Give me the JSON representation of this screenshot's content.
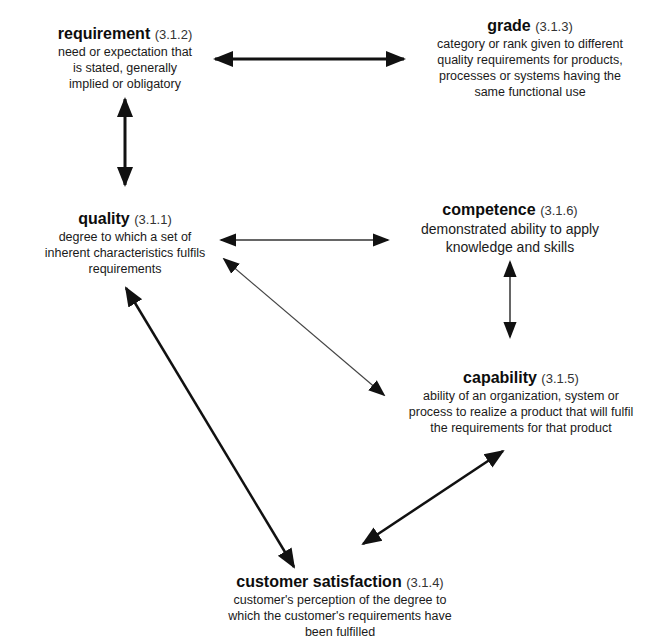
{
  "diagram": {
    "concepts": [
      {
        "id": "requirement",
        "term": "requirement",
        "ref": "(3.1.2)",
        "definition": "need or expectation that\nis stated, generally\nimplied or obligatory"
      },
      {
        "id": "grade",
        "term": "grade",
        "ref": "(3.1.3)",
        "definition": "category or rank given to different\nquality requirements for products,\nprocesses or systems having the\nsame functional use"
      },
      {
        "id": "quality",
        "term": "quality",
        "ref": "(3.1.1)",
        "definition": "degree to which a set of\ninherent characteristics fulfils\nrequirements"
      },
      {
        "id": "competence",
        "term": "competence",
        "ref": "(3.1.6)",
        "definition": "demonstrated ability to apply\nknowledge and skills"
      },
      {
        "id": "capability",
        "term": "capability",
        "ref": "(3.1.5)",
        "definition": "ability of an organization, system or\nprocess to realize a product that will fulfil\nthe requirements for that product"
      },
      {
        "id": "customer_satisfaction",
        "term": "customer satisfaction",
        "ref": "(3.1.4)",
        "definition": "customer's perception of the degree to\nwhich the customer's requirements have\nbeen fulfilled"
      }
    ],
    "relationships": [
      {
        "from": "requirement",
        "to": "grade",
        "type": "bidirectional",
        "weight": "thick"
      },
      {
        "from": "requirement",
        "to": "quality",
        "type": "bidirectional",
        "weight": "thick"
      },
      {
        "from": "quality",
        "to": "competence",
        "type": "bidirectional",
        "weight": "thin"
      },
      {
        "from": "quality",
        "to": "capability",
        "type": "bidirectional",
        "weight": "thin"
      },
      {
        "from": "competence",
        "to": "capability",
        "type": "bidirectional",
        "weight": "thin"
      },
      {
        "from": "quality",
        "to": "customer_satisfaction",
        "type": "bidirectional",
        "weight": "thick"
      },
      {
        "from": "capability",
        "to": "customer_satisfaction",
        "type": "bidirectional",
        "weight": "thick"
      }
    ],
    "colors": {
      "background": "#ffffff",
      "ink": "#111111"
    }
  }
}
